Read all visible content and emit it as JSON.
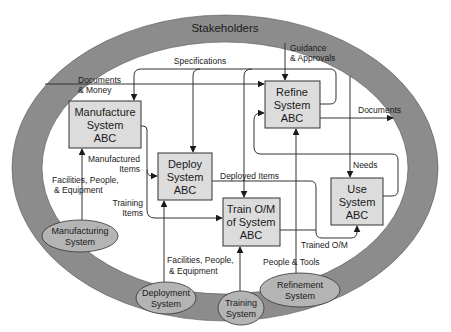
{
  "colors": {
    "ring": "#8c8c8c",
    "box_fill": "#dcdcdc",
    "ellipse_fill": "#b4b4b4",
    "stroke": "#333333",
    "background": "#ffffff"
  },
  "ring": {
    "label": "Stakeholders"
  },
  "processes": [
    {
      "id": "manufacture",
      "lines": [
        "Manufacture",
        "System",
        "ABC"
      ]
    },
    {
      "id": "refine",
      "lines": [
        "Refine",
        "System",
        "ABC"
      ]
    },
    {
      "id": "deploy",
      "lines": [
        "Deploy",
        "System",
        "ABC"
      ]
    },
    {
      "id": "train",
      "lines": [
        "Train O/M",
        "of System",
        "ABC"
      ]
    },
    {
      "id": "use",
      "lines": [
        "Use",
        "System",
        "ABC"
      ]
    }
  ],
  "enablers": [
    {
      "id": "manufacturing",
      "lines": [
        "Manufacturing",
        "System"
      ]
    },
    {
      "id": "deployment",
      "lines": [
        "Deployment",
        "System"
      ]
    },
    {
      "id": "training",
      "lines": [
        "Training",
        "System"
      ]
    },
    {
      "id": "refinement",
      "lines": [
        "Refinement",
        "System"
      ]
    }
  ],
  "flows": {
    "documents_money": [
      "Documents",
      "& Money"
    ],
    "specifications": "Specifications",
    "guidance": [
      "Guidance",
      "& Approvals"
    ],
    "documents": "Documents",
    "manufactured_items": [
      "Manufactured",
      "Items"
    ],
    "training_items": [
      "Training",
      "Items"
    ],
    "mfg_facilities": [
      "Facilities, People,",
      "& Equipment"
    ],
    "deploy_facilities": [
      "Facilities, People,",
      "& Equipment"
    ],
    "deployed_items": "Deployed Items",
    "needs": "Needs",
    "trained_om": "Trained O/M",
    "people_tools": "People & Tools"
  }
}
